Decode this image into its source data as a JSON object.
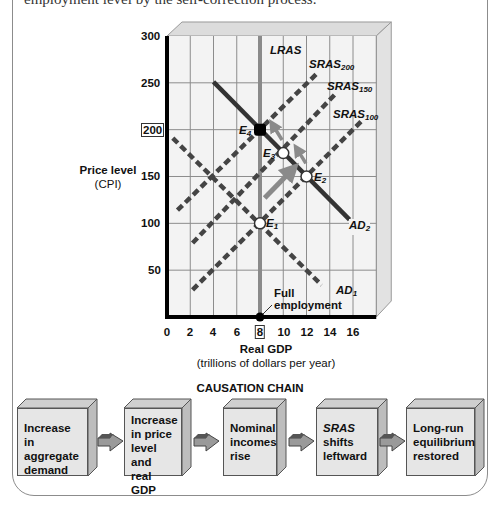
{
  "caption": "employment level by the self-correction process.",
  "chart_data": {
    "type": "line",
    "title": "",
    "xlabel": "Real GDP",
    "xlabel_sub": "(trillions of dollars per year)",
    "ylabel": "Price level",
    "ylabel_sub": "(CPI)",
    "xlim": [
      0,
      18
    ],
    "ylim": [
      0,
      300
    ],
    "x_ticks": [
      0,
      2,
      4,
      6,
      8,
      10,
      12,
      14,
      16
    ],
    "y_ticks": [
      50,
      100,
      150,
      200,
      250,
      300
    ],
    "highlighted_x_tick": 8,
    "highlighted_y_tick": 200,
    "grid": true,
    "series": [
      {
        "name": "LRAS",
        "style": "solid",
        "color": "#8a8a8a",
        "points": [
          [
            8,
            0
          ],
          [
            8,
            300
          ]
        ]
      },
      {
        "name": "AD1",
        "style": "dashed",
        "color": "#444444",
        "points": [
          [
            0.5,
            191
          ],
          [
            13.3,
            34
          ]
        ]
      },
      {
        "name": "AD2",
        "style": "solid",
        "color": "#333333",
        "points": [
          [
            4,
            251
          ],
          [
            15.7,
            104
          ]
        ]
      },
      {
        "name": "SRAS100",
        "style": "dashed",
        "color": "#444444",
        "points": [
          [
            2.2,
            29
          ],
          [
            16.8,
            210
          ]
        ]
      },
      {
        "name": "SRAS150",
        "style": "dashed",
        "color": "#444444",
        "points": [
          [
            2.2,
            79
          ],
          [
            14.4,
            237
          ]
        ]
      },
      {
        "name": "SRAS200",
        "style": "dashed",
        "color": "#444444",
        "points": [
          [
            0.9,
            114
          ],
          [
            12.9,
            260
          ]
        ]
      }
    ],
    "equilibria": [
      {
        "name": "E1",
        "x": 8,
        "y": 100,
        "fill": "white"
      },
      {
        "name": "E2",
        "x": 12,
        "y": 150,
        "fill": "white"
      },
      {
        "name": "E3",
        "x": 10,
        "y": 175,
        "fill": "white"
      },
      {
        "name": "E4",
        "x": 8,
        "y": 200,
        "fill": "black"
      }
    ],
    "movement_arrows": [
      [
        [
          8.4,
          127
        ],
        [
          10.75,
          157
        ]
      ],
      [
        [
          11.95,
          164
        ],
        [
          11.2,
          179
        ]
      ],
      [
        [
          9.9,
          189
        ],
        [
          9.1,
          205
        ]
      ]
    ],
    "annotations": [
      {
        "text": "Full employment",
        "x": 8,
        "y": 0
      }
    ]
  },
  "labels": {
    "lras": "LRAS",
    "sras": "SRAS",
    "sras200_sub": "200",
    "sras150_sub": "150",
    "sras100_sub": "100",
    "ad": "AD",
    "ad1_sub": "1",
    "ad2_sub": "2",
    "e": "E",
    "e1_sub": "1",
    "e2_sub": "2",
    "e3_sub": "3",
    "e4_sub": "4",
    "full_line1": "Full",
    "full_line2": "employment",
    "price_level": "Price level",
    "cpi": "(CPI)",
    "real_gdp": "Real GDP",
    "gdp_units": "(trillions of dollars per year)",
    "y300": "300",
    "y250": "250",
    "y200": "200",
    "y150": "150",
    "y100": "100",
    "y50": "50",
    "x0": "0",
    "x2": "2",
    "x4": "4",
    "x6": "6",
    "x8": "8",
    "x10": "10",
    "x12": "12",
    "x14": "14",
    "x16": "16"
  },
  "causation_chain": {
    "title": "CAUSATION CHAIN",
    "steps": [
      {
        "l1": "Increase in",
        "l2": "aggregate",
        "l3": "demand",
        "l4": ""
      },
      {
        "l1": "Increase",
        "l2": "in price",
        "l3": "level and",
        "l4": "real GDP"
      },
      {
        "l1": "Nominal",
        "l2": "incomes",
        "l3": "rise",
        "l4": ""
      },
      {
        "l1": "SRAS",
        "l2": "shifts",
        "l3": "leftward",
        "l4": ""
      },
      {
        "l1": "Long-run",
        "l2": "equilibrium",
        "l3": "restored",
        "l4": ""
      }
    ]
  }
}
